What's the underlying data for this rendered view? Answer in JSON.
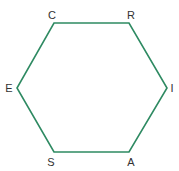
{
  "diagram": {
    "type": "hexagon",
    "stroke_color": "#2e8a62",
    "stroke_width": 1.6,
    "vertices": [
      {
        "label": "C",
        "x": 54,
        "y": 23,
        "lx": 52,
        "ly": 19
      },
      {
        "label": "R",
        "x": 129,
        "y": 23,
        "lx": 131,
        "ly": 19
      },
      {
        "label": "I",
        "x": 167,
        "y": 88,
        "lx": 172,
        "ly": 92
      },
      {
        "label": "A",
        "x": 129,
        "y": 152,
        "lx": 131,
        "ly": 166
      },
      {
        "label": "S",
        "x": 54,
        "y": 152,
        "lx": 51,
        "ly": 166
      },
      {
        "label": "E",
        "x": 17,
        "y": 88,
        "lx": 9,
        "ly": 92
      }
    ]
  }
}
